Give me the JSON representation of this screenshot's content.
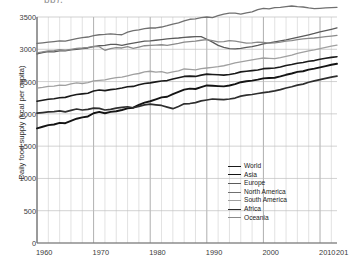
{
  "title_fragment": "pp),",
  "axes": {
    "ylabel": "Daily food supply (kcal per capita)",
    "yticks": [
      "0",
      "500",
      "1000",
      "1500",
      "2000",
      "2500",
      "3000",
      "3500"
    ],
    "xticks": [
      "1960",
      "1970",
      "1980",
      "1990",
      "2000",
      "2010",
      "201"
    ]
  },
  "chart_data": {
    "type": "line",
    "title": "Daily food supply (kcal per capita)",
    "xlabel": "",
    "ylabel": "Daily food supply (kcal per capita)",
    "xlim": [
      1960,
      2013
    ],
    "ylim": [
      0,
      3500
    ],
    "ytick_step": 500,
    "grid": true,
    "grid_x_interval": 2,
    "legend_position": "inside-bottom-right",
    "x": [
      1960,
      1961,
      1962,
      1963,
      1964,
      1965,
      1966,
      1967,
      1968,
      1969,
      1970,
      1971,
      1972,
      1973,
      1974,
      1975,
      1976,
      1977,
      1978,
      1979,
      1980,
      1981,
      1982,
      1983,
      1984,
      1985,
      1986,
      1987,
      1988,
      1989,
      1990,
      1991,
      1992,
      1993,
      1994,
      1995,
      1996,
      1997,
      1998,
      1999,
      2000,
      2001,
      2002,
      2003,
      2004,
      2005,
      2006,
      2007,
      2008,
      2009,
      2010,
      2011,
      2012,
      2013
    ],
    "series": [
      {
        "name": "World",
        "color": "#1a1a1a",
        "width": 1.6,
        "values": [
          2196,
          2210,
          2225,
          2235,
          2250,
          2255,
          2280,
          2300,
          2310,
          2320,
          2355,
          2370,
          2360,
          2375,
          2385,
          2400,
          2420,
          2425,
          2450,
          2470,
          2480,
          2495,
          2510,
          2515,
          2540,
          2560,
          2580,
          2585,
          2580,
          2600,
          2615,
          2610,
          2605,
          2600,
          2610,
          2625,
          2650,
          2660,
          2670,
          2680,
          2700,
          2705,
          2710,
          2725,
          2750,
          2765,
          2785,
          2795,
          2815,
          2825,
          2845,
          2860,
          2875,
          2885
        ]
      },
      {
        "name": "Asia",
        "color": "#141414",
        "width": 1.9,
        "values": [
          1775,
          1800,
          1825,
          1835,
          1860,
          1855,
          1890,
          1925,
          1945,
          1960,
          2010,
          2030,
          2010,
          2030,
          2040,
          2060,
          2085,
          2095,
          2140,
          2175,
          2195,
          2225,
          2255,
          2265,
          2305,
          2340,
          2375,
          2390,
          2385,
          2415,
          2440,
          2435,
          2430,
          2425,
          2440,
          2460,
          2490,
          2505,
          2515,
          2530,
          2550,
          2555,
          2560,
          2580,
          2605,
          2625,
          2650,
          2660,
          2685,
          2700,
          2720,
          2740,
          2760,
          2775
        ]
      },
      {
        "name": "Europe",
        "color": "#5b5b5b",
        "width": 1.3,
        "values": [
          2930,
          2950,
          2965,
          2960,
          2975,
          2975,
          2990,
          3000,
          3010,
          3020,
          3040,
          3055,
          3060,
          3075,
          3075,
          3060,
          3080,
          3095,
          3110,
          3125,
          3130,
          3140,
          3150,
          3160,
          3170,
          3175,
          3185,
          3190,
          3195,
          3195,
          3155,
          3110,
          3060,
          3030,
          3010,
          3005,
          3015,
          3030,
          3040,
          3060,
          3085,
          3100,
          3115,
          3130,
          3145,
          3165,
          3185,
          3205,
          3225,
          3245,
          3270,
          3290,
          3310,
          3330
        ]
      },
      {
        "name": "North America",
        "color": "#707070",
        "width": 1.3,
        "values": [
          3090,
          3100,
          3110,
          3120,
          3130,
          3125,
          3145,
          3165,
          3180,
          3190,
          3210,
          3225,
          3230,
          3240,
          3230,
          3225,
          3265,
          3290,
          3300,
          3320,
          3330,
          3330,
          3345,
          3365,
          3390,
          3410,
          3440,
          3465,
          3470,
          3490,
          3500,
          3490,
          3520,
          3545,
          3560,
          3560,
          3545,
          3565,
          3580,
          3615,
          3635,
          3625,
          3645,
          3650,
          3660,
          3670,
          3660,
          3655,
          3640,
          3630,
          3635,
          3640,
          3645,
          3650
        ]
      },
      {
        "name": "South America",
        "color": "#a0a0a0",
        "width": 1.3,
        "values": [
          2400,
          2410,
          2425,
          2430,
          2445,
          2440,
          2465,
          2480,
          2470,
          2485,
          2510,
          2520,
          2525,
          2545,
          2560,
          2570,
          2590,
          2610,
          2625,
          2650,
          2660,
          2645,
          2655,
          2630,
          2650,
          2665,
          2695,
          2690,
          2680,
          2700,
          2710,
          2720,
          2730,
          2745,
          2765,
          2790,
          2805,
          2820,
          2835,
          2850,
          2865,
          2860,
          2855,
          2870,
          2890,
          2910,
          2935,
          2955,
          2975,
          2990,
          3010,
          3030,
          3050,
          3065
        ]
      },
      {
        "name": "Africa",
        "color": "#2e2e2e",
        "width": 1.7,
        "values": [
          2010,
          2020,
          2030,
          2035,
          2045,
          2030,
          2055,
          2075,
          2060,
          2070,
          2090,
          2085,
          2060,
          2070,
          2090,
          2100,
          2110,
          2095,
          2115,
          2140,
          2150,
          2140,
          2130,
          2105,
          2080,
          2115,
          2155,
          2160,
          2175,
          2200,
          2215,
          2230,
          2225,
          2220,
          2230,
          2245,
          2275,
          2290,
          2300,
          2315,
          2330,
          2340,
          2355,
          2375,
          2400,
          2420,
          2445,
          2460,
          2490,
          2510,
          2530,
          2550,
          2570,
          2585
        ]
      },
      {
        "name": "Oceania",
        "color": "#8a8a8a",
        "width": 1.3,
        "values": [
          2945,
          2960,
          2975,
          2980,
          2995,
          2985,
          3000,
          3015,
          3020,
          3030,
          3045,
          3040,
          2985,
          3010,
          3025,
          3020,
          3040,
          3015,
          3035,
          3055,
          3060,
          3065,
          3070,
          3060,
          3075,
          3090,
          3110,
          3120,
          3125,
          3140,
          3150,
          3135,
          3115,
          3120,
          3135,
          3125,
          3110,
          3095,
          3100,
          3110,
          3105,
          3095,
          3100,
          3110,
          3125,
          3135,
          3150,
          3160,
          3170,
          3175,
          3185,
          3195,
          3205,
          3215
        ]
      }
    ]
  },
  "legend": {
    "items": [
      {
        "label": "World"
      },
      {
        "label": "Asia"
      },
      {
        "label": "Europe"
      },
      {
        "label": "North America"
      },
      {
        "label": "South America"
      },
      {
        "label": "Africa"
      },
      {
        "label": "Oceania"
      }
    ]
  }
}
